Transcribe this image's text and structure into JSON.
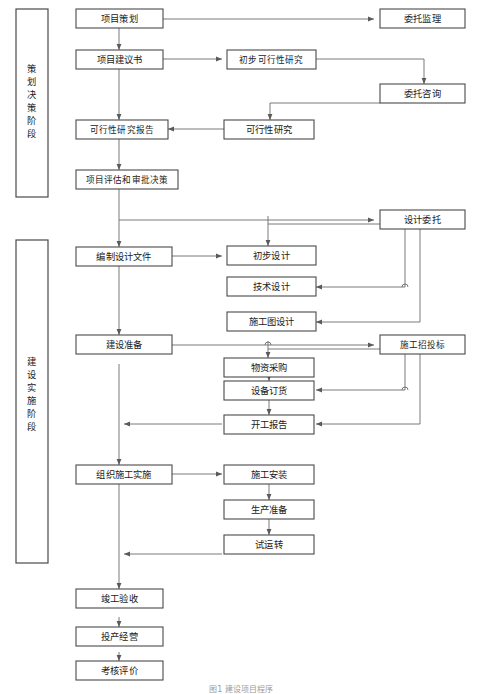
{
  "figure": {
    "caption": "图1 建设项目程序",
    "type": "flowchart",
    "orientation": "top-to-bottom",
    "line_color": "#6b6b6b",
    "box_fill": "#ffffff",
    "box_stroke": "#4a4a4a",
    "text_color": "#1b1b1b"
  },
  "phases": [
    {
      "id": "phase-planning",
      "label": "策划决策阶段",
      "chars": [
        "策",
        "划",
        "决",
        "策",
        "阶",
        "段"
      ]
    },
    {
      "id": "phase-construction",
      "label": "建设实施阶段",
      "chars": [
        "建",
        "设",
        "实",
        "施",
        "阶",
        "段"
      ]
    }
  ],
  "nodes": {
    "n1": {
      "label": "项目策划",
      "column": "left"
    },
    "n2": {
      "label": "委托监理",
      "column": "right"
    },
    "n3": {
      "label": "项目建议书",
      "column": "left"
    },
    "n4": {
      "label": "初步可行性研究",
      "column": "middle"
    },
    "n5": {
      "label": "委托咨询",
      "column": "right"
    },
    "n6": {
      "label": "可行性研究报告",
      "column": "left"
    },
    "n7": {
      "label": "可行性研究",
      "column": "middle"
    },
    "n8": {
      "label": "项目评估和审批决策",
      "column": "left"
    },
    "n9": {
      "label": "设计委托",
      "column": "right"
    },
    "n10": {
      "label": "编制设计文件",
      "column": "left"
    },
    "n11": {
      "label": "初步设计",
      "column": "middle"
    },
    "n12": {
      "label": "技术设计",
      "column": "middle"
    },
    "n13": {
      "label": "施工图设计",
      "column": "middle"
    },
    "n14": {
      "label": "建设准备",
      "column": "left"
    },
    "n15": {
      "label": "施工招投标",
      "column": "right"
    },
    "n16": {
      "label": "物资采购",
      "column": "middle"
    },
    "n17": {
      "label": "设备订货",
      "column": "middle"
    },
    "n18": {
      "label": "开工报告",
      "column": "middle"
    },
    "n19": {
      "label": "组织施工实施",
      "column": "left"
    },
    "n20": {
      "label": "施工安装",
      "column": "middle"
    },
    "n21": {
      "label": "生产准备",
      "column": "middle"
    },
    "n22": {
      "label": "试运转",
      "column": "middle"
    },
    "n23": {
      "label": "竣工验收",
      "column": "left"
    },
    "n24": {
      "label": "投产经营",
      "column": "left"
    },
    "n25": {
      "label": "考核评价",
      "column": "left"
    }
  },
  "edges": [
    {
      "from": "n1",
      "to": "n2",
      "kind": "horizontal-right"
    },
    {
      "from": "n1",
      "to": "n3",
      "kind": "vertical-down"
    },
    {
      "from": "n3",
      "to": "n4",
      "kind": "horizontal-right"
    },
    {
      "from": "n4",
      "to": "n5",
      "kind": "elbow-down-right"
    },
    {
      "from": "n5",
      "to": "n7",
      "kind": "elbow-left-down"
    },
    {
      "from": "n7",
      "to": "n6",
      "kind": "horizontal-left"
    },
    {
      "from": "n3",
      "to": "n6",
      "kind": "vertical-down"
    },
    {
      "from": "n6",
      "to": "n8",
      "kind": "vertical-down"
    },
    {
      "from": "n8",
      "to": "n9",
      "kind": "elbow-down-right"
    },
    {
      "from": "n8",
      "to": "n10",
      "kind": "vertical-down"
    },
    {
      "from": "n9",
      "to": "n11",
      "kind": "elbow-down-left"
    },
    {
      "from": "n9",
      "to": "n12",
      "kind": "elbow-down-left"
    },
    {
      "from": "n9",
      "to": "n13",
      "kind": "elbow-down-left"
    },
    {
      "from": "n10",
      "to": "n11",
      "kind": "horizontal-right"
    },
    {
      "from": "n10",
      "to": "n14",
      "kind": "vertical-down"
    },
    {
      "from": "n14",
      "to": "n15",
      "kind": "horizontal-right"
    },
    {
      "from": "n15",
      "to": "n16",
      "kind": "elbow-down-left"
    },
    {
      "from": "n15",
      "to": "n17",
      "kind": "elbow-down-left"
    },
    {
      "from": "n15",
      "to": "n18",
      "kind": "elbow-down-left"
    },
    {
      "from": "n16",
      "to": "n17",
      "kind": "vertical-down"
    },
    {
      "from": "n17",
      "to": "n18",
      "kind": "vertical-down"
    },
    {
      "from": "n18",
      "to": "n19",
      "kind": "horizontal-left"
    },
    {
      "from": "n14",
      "to": "n19",
      "kind": "vertical-down"
    },
    {
      "from": "n19",
      "to": "n20",
      "kind": "horizontal-right"
    },
    {
      "from": "n20",
      "to": "n21",
      "kind": "vertical-down"
    },
    {
      "from": "n21",
      "to": "n22",
      "kind": "vertical-down"
    },
    {
      "from": "n22",
      "to": "n23",
      "kind": "elbow-left-down"
    },
    {
      "from": "n23",
      "to": "n24",
      "kind": "vertical-down"
    },
    {
      "from": "n24",
      "to": "n25",
      "kind": "vertical-down"
    }
  ]
}
